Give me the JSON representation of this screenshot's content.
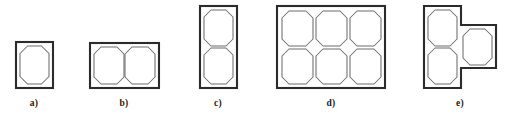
{
  "figure": {
    "background_color": "#ffffff",
    "outline_color": "#2b2b2b",
    "cavity_color": "#6d6d6d",
    "label_color": "#1a1a1a",
    "variants": [
      {
        "id": "a",
        "label": "a)",
        "label_x": 34,
        "label_y": 106,
        "cavity_count": 1,
        "columns": 1,
        "rows": 1,
        "shape": "rectangle",
        "plate": {
          "x": 16,
          "y": 42,
          "width": 37,
          "height": 46
        },
        "cavities": [
          {
            "x": 20,
            "y": 46,
            "width": 29,
            "height": 38
          }
        ]
      },
      {
        "id": "b",
        "label": "b)",
        "label_x": 124,
        "label_y": 106,
        "cavity_count": 2,
        "columns": 2,
        "rows": 1,
        "shape": "rectangle",
        "plate": {
          "x": 90,
          "y": 43,
          "width": 69,
          "height": 45
        },
        "cavities": [
          {
            "x": 94,
            "y": 47,
            "width": 30,
            "height": 37
          },
          {
            "x": 125,
            "y": 47,
            "width": 30,
            "height": 37
          }
        ]
      },
      {
        "id": "c",
        "label": "c)",
        "label_x": 218,
        "label_y": 106,
        "cavity_count": 2,
        "columns": 1,
        "rows": 2,
        "shape": "rectangle",
        "plate": {
          "x": 200,
          "y": 6,
          "width": 37,
          "height": 82
        },
        "cavities": [
          {
            "x": 204,
            "y": 10,
            "width": 29,
            "height": 36
          },
          {
            "x": 204,
            "y": 48,
            "width": 29,
            "height": 36
          }
        ]
      },
      {
        "id": "d",
        "label": "d)",
        "label_x": 331,
        "label_y": 106,
        "cavity_count": 6,
        "columns": 3,
        "rows": 2,
        "shape": "rectangle",
        "plate": {
          "x": 277,
          "y": 6,
          "width": 108,
          "height": 82
        },
        "cavities": [
          {
            "x": 282,
            "y": 11,
            "width": 31,
            "height": 35
          },
          {
            "x": 316,
            "y": 11,
            "width": 31,
            "height": 35
          },
          {
            "x": 350,
            "y": 11,
            "width": 31,
            "height": 35
          },
          {
            "x": 282,
            "y": 49,
            "width": 31,
            "height": 35
          },
          {
            "x": 316,
            "y": 49,
            "width": 31,
            "height": 35
          },
          {
            "x": 350,
            "y": 49,
            "width": 31,
            "height": 35
          }
        ]
      },
      {
        "id": "e",
        "label": "e)",
        "label_x": 460,
        "label_y": 106,
        "cavity_count": 3,
        "columns": 2,
        "rows": 2,
        "shape": "stepped-t",
        "plate_points": "424,6 461,6 461,25 496,25 496,68 461,68 461,88 424,88",
        "cavities": [
          {
            "x": 428,
            "y": 10,
            "width": 29,
            "height": 36
          },
          {
            "x": 428,
            "y": 48,
            "width": 29,
            "height": 36
          },
          {
            "x": 463,
            "y": 29,
            "width": 29,
            "height": 36
          }
        ]
      }
    ]
  }
}
